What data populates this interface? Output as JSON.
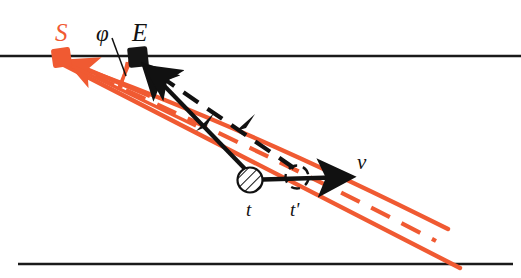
{
  "figure": {
    "background_color": "#ffffff",
    "width": 521,
    "height": 278,
    "ray_color": "#f05a32",
    "beam_color": "#111111",
    "axis_color": "#1a1a1a"
  },
  "labels": {
    "source": "S",
    "emitter": "E",
    "angle": "φ",
    "time_one": "t",
    "time_two": "t'",
    "velocity": "v"
  },
  "elements": {
    "top_axis_name": "upper-horizontal-line",
    "bottom_axis_name": "lower-horizontal-line",
    "source_marker_name": "source-square-marker",
    "emitter_marker_name": "emitter-square-marker",
    "hatched_circle_name": "hatched-particle-circle",
    "dashed_circle_name": "dashed-particle-circle",
    "velocity_arrow_name": "velocity-arrow",
    "angle_leader_name": "angle-leader-line",
    "angle_tick_name": "angle-tick-mark"
  },
  "geometry": {
    "source_point": [
      61,
      58
    ],
    "emitter_point": [
      138,
      58
    ],
    "hatched_circle_center": [
      250,
      180
    ],
    "hatched_circle_radius": 12,
    "dashed_circle_center": [
      297,
      177
    ],
    "dashed_circle_radius": 11,
    "top_line_y": 56,
    "bottom_line_y": 264,
    "velocity_arrow_from": [
      250,
      180
    ],
    "velocity_arrow_to": [
      356,
      178
    ]
  }
}
